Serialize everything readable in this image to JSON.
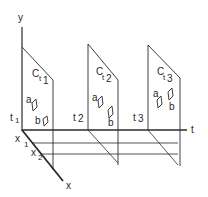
{
  "diagram": {
    "axes": {
      "y_label": "y",
      "t_label": "t",
      "x_label": "x",
      "x1_label": "x",
      "x1_sub": "1",
      "x2_label": "x",
      "x2_sub": "2"
    },
    "planes": [
      {
        "name": "C",
        "sub": "t1",
        "time_label": "t",
        "time_sub": "1",
        "obj_a": "a",
        "obj_b": "b"
      },
      {
        "name": "C",
        "sub": "t2",
        "time_label": "t",
        "time_sub": "2",
        "obj_a": "a",
        "obj_b": "b"
      },
      {
        "name": "C",
        "sub": "t3",
        "time_label": "t",
        "time_sub": "3",
        "obj_a": "a",
        "obj_b": "b"
      }
    ],
    "colors": {
      "line": "#2a2a2a",
      "background": "#ffffff"
    }
  }
}
